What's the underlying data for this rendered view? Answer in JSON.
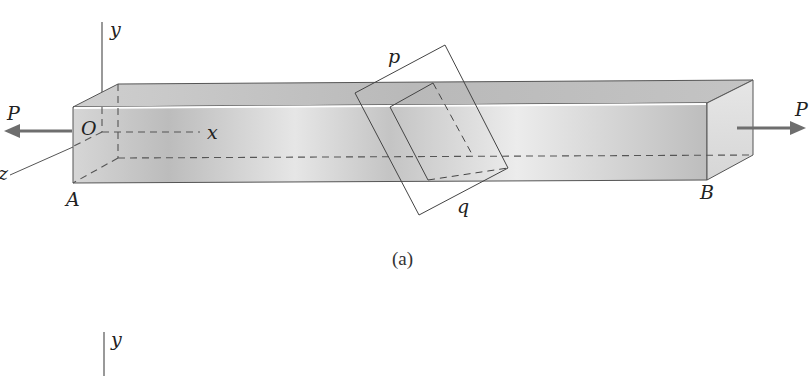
{
  "figure": {
    "caption_a": "(a)",
    "labels": {
      "y_axis_top": "y",
      "x_axis": "x",
      "z_axis": "z",
      "origin": "O",
      "end_a": "A",
      "end_b": "B",
      "load_left": "P",
      "load_right": "P",
      "plane_top": "p",
      "plane_bottom": "q",
      "y_axis_bottom": "y"
    },
    "colors": {
      "bar_front_light": "#ededed",
      "bar_front_dark": "#b4b4b4",
      "bar_top": "#c8c8c8",
      "bar_end": "#e4e4e4",
      "edge": "#555555",
      "arrow": "#6e6e6e"
    }
  }
}
